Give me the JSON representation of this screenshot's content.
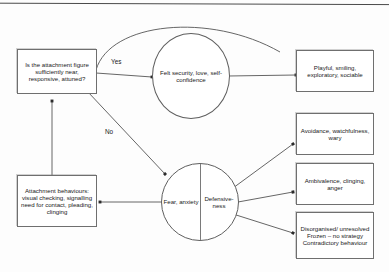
{
  "diagram": {
    "colors": {
      "stroke": "#6f6f6f",
      "text": "#1a1a1a",
      "background": "#fdfdfd",
      "edge": "#555555"
    },
    "nodes": {
      "question_box": {
        "label": "Is the attachment figure sufficiently near, responsive, attuned?",
        "shape": "rectangle"
      },
      "attachment_behaviours_box": {
        "label": "Attachment behaviours: visual checking, signalling need for contact, pleading, clinging",
        "shape": "rectangle"
      },
      "felt_security_circle": {
        "label": "Felt security, love, self-confidence",
        "shape": "circle"
      },
      "fear_defensiveness_circle": {
        "left_label": "Fear, anxiety",
        "right_label": "Defensive-ness",
        "shape": "split-circle"
      },
      "playful_box": {
        "label": "Playful, smiling, exploratory, sociable",
        "shape": "rectangle"
      },
      "avoidance_box": {
        "label": "Avoidance, watchfulness, wary",
        "shape": "rectangle"
      },
      "ambivalence_box": {
        "label": "Ambivalence, clinging, anger",
        "shape": "rectangle"
      },
      "disorganised_box": {
        "label": "Disorganised/ unresolved Frozen – no strategy Contradictory behaviour",
        "shape": "rectangle"
      }
    },
    "edge_labels": {
      "yes": "Yes",
      "no": "No"
    }
  }
}
